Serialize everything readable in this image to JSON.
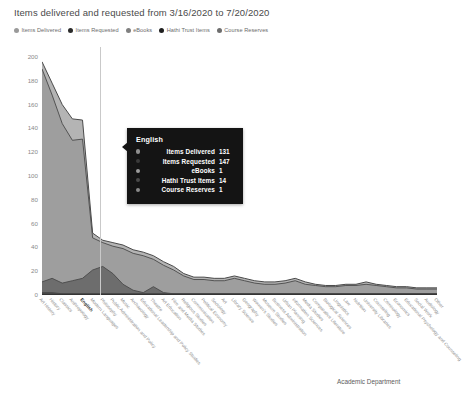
{
  "header": {
    "title": "Items delivered and requested from 3/16/2020 to 7/20/2020"
  },
  "legend": {
    "position": "top-left",
    "items": [
      {
        "label": "Items Delivered",
        "color": "#9a9a9a"
      },
      {
        "label": "Items Requested",
        "color": "#2b2b2b"
      },
      {
        "label": "eBooks",
        "color": "#808080"
      },
      {
        "label": "Hathi Trust Items",
        "color": "#1f1f1f"
      },
      {
        "label": "Course Reserves",
        "color": "#6e6e6e"
      }
    ]
  },
  "axes": {
    "y_label": "Items Delivered , Items Requested, eBooks, Hathi Trust Items and Cour",
    "x_label": "Academic Department",
    "y_ticks": [
      "200",
      "180",
      "160",
      "140",
      "120",
      "100",
      "80",
      "60",
      "40",
      "20",
      "0"
    ]
  },
  "tooltip": {
    "title": "English",
    "rows": [
      {
        "label": "Items Delivered",
        "value": "131",
        "color": "#8f8f8f"
      },
      {
        "label": "Items Requested",
        "value": "147",
        "color": "#3a3a3a"
      },
      {
        "label": "eBooks",
        "value": "1",
        "color": "#9c9c9c"
      },
      {
        "label": "Hathi Trust Items",
        "value": "14",
        "color": "#4a4a4a"
      },
      {
        "label": "Course Reserves",
        "value": "1",
        "color": "#8a8a8a"
      }
    ]
  },
  "chart_data": {
    "type": "area",
    "title": "Items delivered and requested from 3/16/2020 to 7/20/2020",
    "xlabel": "Academic Department",
    "ylabel": "Items Delivered , Items Requested, eBooks, Hathi Trust Items and Cour",
    "ylim": [
      0,
      200
    ],
    "yticks": [
      0,
      20,
      40,
      60,
      80,
      100,
      120,
      140,
      160,
      180,
      200
    ],
    "grid": false,
    "stacked": false,
    "highlighted_category": "English",
    "categories": [
      "Art History",
      "History",
      "Classics",
      "Anthropology",
      "English",
      "Modern Languages",
      "Philosophy",
      "Public Administration and Policy",
      "Music",
      "Archaeology",
      "Educational Leadership and Policy Studies",
      "Theatre",
      "Art Education",
      "Film and Media Studies",
      "Religious Studies",
      "Communication",
      "Political Economy",
      "Sociology",
      "Art",
      "Library Science",
      "Geography",
      "Women's Studies",
      "Museum Studies",
      "Business Administration",
      "Urban Planning",
      "Information Sciences",
      "Media Studies",
      "Comparative Literature",
      "Biological Sciences",
      "Linguistics",
      "Law",
      "Nutrition",
      "University Libraries",
      "Counseling",
      "Criminology",
      "Economics",
      "Educational Psychology and Counseling",
      "Social Work",
      "Audiology",
      "Other"
    ],
    "series": [
      {
        "name": "Items Requested",
        "color": "#b4b4b4",
        "values": [
          196,
          178,
          160,
          148,
          147,
          52,
          46,
          44,
          42,
          38,
          36,
          33,
          28,
          24,
          18,
          15,
          15,
          14,
          14,
          16,
          14,
          12,
          11,
          11,
          12,
          14,
          11,
          9,
          8,
          8,
          9,
          9,
          11,
          9,
          8,
          7,
          7,
          6,
          6,
          6
        ]
      },
      {
        "name": "Items Delivered",
        "color": "#9e9e9e",
        "values": [
          190,
          168,
          144,
          130,
          131,
          48,
          44,
          41,
          39,
          35,
          33,
          30,
          25,
          21,
          16,
          13,
          13,
          12,
          12,
          14,
          12,
          10,
          9,
          9,
          10,
          12,
          9,
          8,
          7,
          7,
          8,
          8,
          9,
          8,
          7,
          6,
          6,
          5,
          5,
          5
        ]
      },
      {
        "name": "Hathi Trust Items",
        "color": "#6d6d6d",
        "values": [
          11,
          14,
          10,
          12,
          14,
          21,
          24,
          18,
          9,
          4,
          2,
          7,
          2,
          1,
          1,
          1,
          1,
          1,
          1,
          1,
          1,
          1,
          1,
          1,
          1,
          1,
          1,
          1,
          1,
          1,
          1,
          1,
          1,
          1,
          1,
          1,
          1,
          1,
          1,
          1
        ]
      },
      {
        "name": "eBooks",
        "color": "#4f4f4f",
        "values": [
          2,
          2,
          1,
          1,
          1,
          1,
          1,
          1,
          1,
          1,
          1,
          1,
          1,
          1,
          1,
          1,
          1,
          1,
          1,
          1,
          1,
          1,
          1,
          1,
          1,
          1,
          1,
          1,
          1,
          1,
          1,
          1,
          1,
          1,
          1,
          1,
          1,
          1,
          1,
          1
        ]
      },
      {
        "name": "Course Reserves",
        "color": "#2f2f2f",
        "values": [
          1,
          1,
          1,
          1,
          1,
          1,
          1,
          1,
          1,
          1,
          1,
          1,
          1,
          1,
          1,
          1,
          1,
          1,
          1,
          1,
          1,
          1,
          1,
          1,
          1,
          1,
          1,
          1,
          1,
          1,
          1,
          1,
          1,
          1,
          1,
          1,
          1,
          1,
          1,
          1
        ]
      }
    ]
  }
}
